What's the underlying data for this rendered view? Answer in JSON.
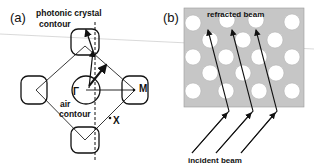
{
  "panel_a": {
    "label": "(a)",
    "photonic_crystal_contour_line1": "photonic crystal",
    "photonic_crystal_contour_line2": "contour",
    "air_contour_line1": "air",
    "air_contour_line2": "contour",
    "gamma_point": "Γ",
    "m_point": "M",
    "x_point": "X"
  },
  "panel_b": {
    "label": "(b)",
    "refracted_beam": "refracted beam",
    "incident_beam": "incident beam"
  },
  "colors": {
    "crystal_bg": "#c8c8c8",
    "holes": "#ffffff",
    "lines": "#111111"
  }
}
